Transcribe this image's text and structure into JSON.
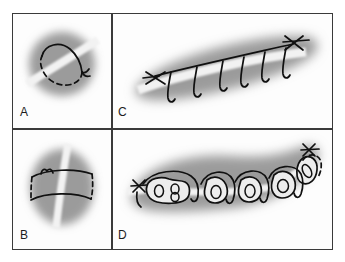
{
  "figure": {
    "width": 345,
    "height": 262,
    "background_color": "#ffffff",
    "border_color": "#3a3a3a",
    "tissue_color": "#9b9b9b",
    "band_color": "#f2f2f2",
    "ink_color": "#101010",
    "lobule_fill": "#ededed"
  },
  "panels": [
    {
      "id": "A",
      "label": "A",
      "name": "panel-a",
      "content": "blurred oval tissue with a diagonal white band and an encircling suture loop, solid above and dashed where it passes beneath the band"
    },
    {
      "id": "B",
      "label": "B",
      "name": "panel-b",
      "content": "blurred oval tissue with a near-vertical white band and a rectangular mattress suture, solid horizontal arcs joined by dashed vertical limbs, knot at upper left"
    },
    {
      "id": "C",
      "label": "C",
      "name": "panel-c",
      "content": "elongated blurred tissue band with a diagonal white strip and a running suture line above it, six hanging loops below, knots at both ends"
    },
    {
      "id": "D",
      "label": "D",
      "name": "panel-d",
      "content": "curved banana-shaped tissue containing five pale lobules with inner rings, running suture arches over each gap, white band segments between lobules, knot at upper right"
    }
  ]
}
